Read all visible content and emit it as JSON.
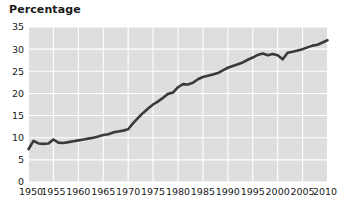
{
  "chart_data": {
    "type": "line",
    "title": "Percentage",
    "xlabel": "",
    "ylabel": "",
    "xlim": [
      1950,
      2010
    ],
    "ylim": [
      0,
      35
    ],
    "grid": true,
    "legend": "none",
    "xticks": [
      1950,
      1955,
      1960,
      1965,
      1970,
      1975,
      1980,
      1985,
      1990,
      1995,
      2000,
      2005,
      2010
    ],
    "yticks": [
      0,
      5,
      10,
      15,
      20,
      25,
      30,
      35
    ],
    "xtick_labels": [
      "1950",
      "1955",
      "1960",
      "1965",
      "1970",
      "1975",
      "1980",
      "1985",
      "1990",
      "1995",
      "2000",
      "2005",
      "2010"
    ],
    "ytick_labels": [
      "0",
      "5",
      "10",
      "15",
      "20",
      "25",
      "30",
      "35"
    ],
    "series": [
      {
        "name": "Percentage",
        "color": "#3a3a3a",
        "x": [
          1950,
          1951,
          1952,
          1953,
          1954,
          1955,
          1956,
          1957,
          1958,
          1959,
          1960,
          1961,
          1962,
          1963,
          1964,
          1965,
          1966,
          1967,
          1968,
          1969,
          1970,
          1971,
          1972,
          1973,
          1974,
          1975,
          1976,
          1977,
          1978,
          1979,
          1980,
          1981,
          1982,
          1983,
          1984,
          1985,
          1986,
          1987,
          1988,
          1989,
          1990,
          1991,
          1992,
          1993,
          1994,
          1995,
          1996,
          1997,
          1998,
          1999,
          2000,
          2001,
          2002,
          2003,
          2004,
          2005,
          2006,
          2007,
          2008,
          2009,
          2010
        ],
        "values": [
          7.4,
          9.3,
          8.7,
          8.6,
          8.7,
          9.6,
          8.9,
          8.8,
          9.0,
          9.2,
          9.4,
          9.6,
          9.8,
          10.0,
          10.3,
          10.6,
          10.8,
          11.2,
          11.4,
          11.6,
          11.9,
          13.3,
          14.5,
          15.6,
          16.6,
          17.5,
          18.2,
          19.0,
          19.9,
          20.2,
          21.4,
          22.1,
          22.0,
          22.4,
          23.2,
          23.7,
          24.0,
          24.3,
          24.6,
          25.2,
          25.8,
          26.2,
          26.6,
          27.0,
          27.6,
          28.1,
          28.7,
          29.0,
          28.6,
          28.9,
          28.6,
          27.7,
          29.2,
          29.4,
          29.7,
          30.0,
          30.4,
          30.8,
          31.0,
          31.5,
          32.0
        ]
      }
    ]
  }
}
